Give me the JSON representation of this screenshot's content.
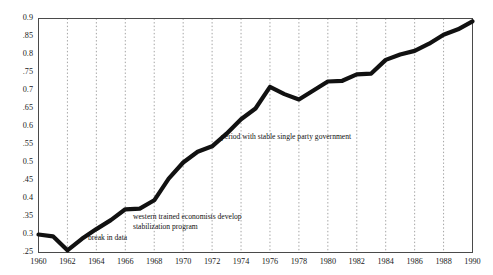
{
  "chart_data": {
    "type": "line",
    "title": "",
    "subtitle": "",
    "xlabel": "",
    "ylabel": "",
    "xlim": [
      1960,
      1990
    ],
    "ylim": [
      0.25,
      0.9
    ],
    "grid": "vertical-dotted",
    "legend": "none",
    "x_tick_labels": [
      "1960",
      "1962",
      "1964",
      "1966",
      "1968",
      "1970",
      "1972",
      "1974",
      "1976",
      "1978",
      "1980",
      "1982",
      "1984",
      "1986",
      "1988",
      "1990"
    ],
    "x_tick_values": [
      1960,
      1962,
      1964,
      1966,
      1968,
      1970,
      1972,
      1974,
      1976,
      1978,
      1980,
      1982,
      1984,
      1986,
      1988,
      1990
    ],
    "y_tick_labels": [
      "0.9",
      ".85",
      "0.8",
      ".75",
      "0.7",
      ".65",
      "0.6",
      ".55",
      "0.5",
      ".45",
      "0.4",
      ".35",
      "0.3",
      ".25"
    ],
    "y_tick_values": [
      0.9,
      0.85,
      0.8,
      0.75,
      0.7,
      0.65,
      0.6,
      0.55,
      0.5,
      0.45,
      0.4,
      0.35,
      0.3,
      0.25
    ],
    "series": [
      {
        "name": "series-1",
        "color": "#111111",
        "x": [
          1960,
          1961,
          1962,
          1963,
          1964,
          1965,
          1966,
          1967,
          1968,
          1969,
          1970,
          1971,
          1972,
          1973,
          1974,
          1975,
          1976,
          1977,
          1978,
          1979,
          1980,
          1981,
          1982,
          1983,
          1984,
          1985,
          1986,
          1987,
          1988,
          1989,
          1990
        ],
        "values": [
          0.3,
          0.295,
          0.256,
          0.288,
          0.315,
          0.34,
          0.37,
          0.372,
          0.395,
          0.455,
          0.5,
          0.53,
          0.545,
          0.58,
          0.62,
          0.65,
          0.71,
          0.69,
          0.675,
          0.7,
          0.725,
          0.727,
          0.745,
          0.747,
          0.785,
          0.8,
          0.81,
          0.83,
          0.855,
          0.87,
          0.892
        ]
      }
    ],
    "annotations": [
      {
        "id": "break-in-data",
        "text": "break in data",
        "x_px": 88,
        "y_px": 234
      },
      {
        "id": "stabilization-line-1",
        "text": "western trained economists develop",
        "x_px": 133,
        "y_px": 213
      },
      {
        "id": "stabilization-line-2",
        "text": "stabilization program",
        "x_px": 133,
        "y_px": 223
      },
      {
        "id": "stable-government",
        "text": "period with stable single party government",
        "x_px": 221,
        "y_px": 133
      }
    ],
    "colors": {
      "line": "#111111",
      "grid": "#8c8c8c",
      "frame": "#4a4a4a",
      "background": "#ffffff",
      "text": "#1a1a1a"
    }
  }
}
